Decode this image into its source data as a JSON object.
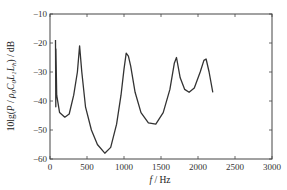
{
  "chart_data": {
    "type": "line",
    "title": "",
    "xlabel": "f / Hz",
    "ylabel": "10lg(P / ρ0C0L1Lh) / dB",
    "xlim": [
      0,
      3000
    ],
    "ylim": [
      -60,
      -10
    ],
    "xticks": [
      0,
      500,
      1000,
      1500,
      2000,
      2500,
      3000
    ],
    "yticks": [
      -10,
      -20,
      -30,
      -40,
      -50,
      -60
    ],
    "xtick_labels": [
      "0",
      "500",
      "1000",
      "1500",
      "2000",
      "2500",
      "3000"
    ],
    "ytick_labels": [
      "-10",
      "-20",
      "-30",
      "-40",
      "-50",
      "-60"
    ],
    "grid": false,
    "legend": null,
    "series": [
      {
        "name": "sound power level",
        "color": "#333333",
        "x": [
          75,
          78,
          80,
          90,
          130,
          200,
          260,
          320,
          370,
          400,
          430,
          480,
          560,
          640,
          740,
          820,
          900,
          960,
          1000,
          1030,
          1060,
          1090,
          1150,
          1230,
          1330,
          1430,
          1530,
          1620,
          1680,
          1710,
          1760,
          1820,
          1880,
          1950,
          2030,
          2080,
          2110,
          2150,
          2200
        ],
        "y": [
          -19,
          -42,
          -22,
          -38,
          -44,
          -45.6,
          -44.5,
          -38,
          -30,
          -21,
          -30,
          -42,
          -50,
          -55,
          -58,
          -56,
          -48,
          -38,
          -29,
          -23.5,
          -24.5,
          -28,
          -37,
          -44,
          -47.5,
          -48,
          -44,
          -36,
          -27,
          -25,
          -32,
          -36,
          -37,
          -35.5,
          -30,
          -26,
          -25.5,
          -30,
          -37
        ]
      }
    ]
  }
}
